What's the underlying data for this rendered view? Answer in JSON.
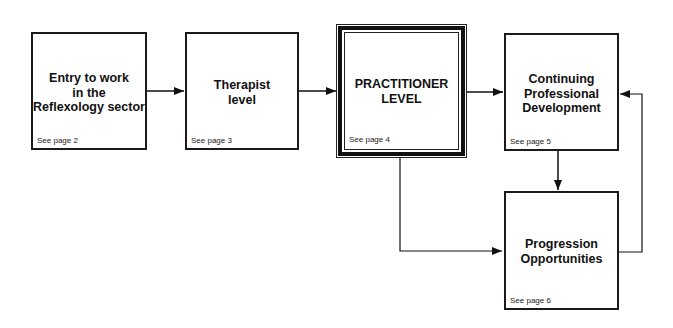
{
  "diagram": {
    "boxes": [
      {
        "id": "entry",
        "title": "Entry to work\nin the\nReflexology sector",
        "ref": "See page 2"
      },
      {
        "id": "therapist",
        "title": "Therapist\nlevel",
        "ref": "See page 3"
      },
      {
        "id": "practitioner",
        "title": "PRACTITIONER\nLEVEL",
        "ref": "See page 4"
      },
      {
        "id": "cpd",
        "title": "Continuing\nProfessional\nDevelopment",
        "ref": "See page 5"
      },
      {
        "id": "progression",
        "title": "Progression\nOpportunities",
        "ref": "See page 6"
      }
    ],
    "edges": [
      {
        "from": "entry",
        "to": "therapist"
      },
      {
        "from": "therapist",
        "to": "practitioner"
      },
      {
        "from": "practitioner",
        "to": "cpd"
      },
      {
        "from": "practitioner",
        "to": "progression"
      },
      {
        "from": "cpd",
        "to": "progression"
      },
      {
        "from": "progression",
        "to": "cpd"
      }
    ],
    "colors": {
      "line": "#111111",
      "background": "#ffffff"
    }
  }
}
